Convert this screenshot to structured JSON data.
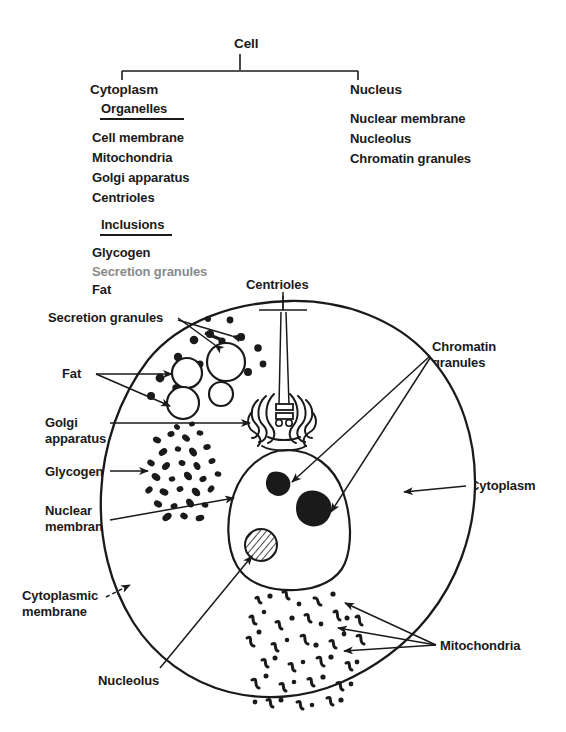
{
  "figure": {
    "type": "biology-diagram"
  },
  "classification_chart": {
    "root": "Cell",
    "branches": [
      {
        "name": "Cytoplasm",
        "groups": [
          {
            "heading": "Organelles",
            "items": [
              "Cell membrane",
              "Mitochondria",
              "Golgi apparatus",
              "Centrioles"
            ]
          },
          {
            "heading": "Inclusions",
            "items": [
              "Glycogen",
              "Secretion granules",
              "Fat"
            ]
          }
        ]
      },
      {
        "name": "Nucleus",
        "groups": [
          {
            "heading": "",
            "items": [
              "Nuclear membrane",
              "Nucleolus",
              "Chromatin granules"
            ]
          }
        ]
      }
    ]
  },
  "diagram_labels": {
    "centrioles": "Centrioles",
    "secretion_granules": "Secretion granules",
    "fat": "Fat",
    "golgi_line1": "Golgi",
    "golgi_line2": "apparatus",
    "glycogen": "Glycogen",
    "nuclear_membrane_line1": "Nuclear",
    "nuclear_membrane_line2": "membrane",
    "cytoplasmic_membrane_line1": "Cytoplasmic",
    "cytoplasmic_membrane_line2": "membrane",
    "nucleolus": "Nucleolus",
    "chromatin_line1": "Chromatin",
    "chromatin_line2": "granules",
    "cytoplasm": "Cytoplasm",
    "mitochondria": "Mitochondria"
  },
  "colors": {
    "ink": "#1a1a1a",
    "paper": "#ffffff",
    "faded_ink": "#8a8a8a"
  }
}
